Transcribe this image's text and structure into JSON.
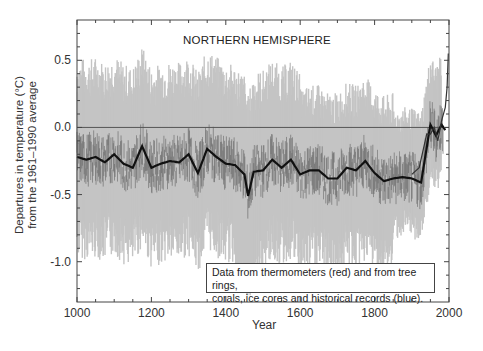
{
  "chart_data": {
    "type": "line",
    "title": "NORTHERN HEMISPHERE",
    "xlabel": "Year",
    "ylabel_line1": "Departures in temperature (°C)",
    "ylabel_line2": "from the 1961–1990 average",
    "xlim": [
      1000,
      2000
    ],
    "ylim": [
      -1.3,
      0.8
    ],
    "xticks": [
      1000,
      1200,
      1400,
      1600,
      1800,
      2000
    ],
    "xtick_labels": [
      "1000",
      "1200",
      "1400",
      "1600",
      "1800",
      "2000"
    ],
    "yticks": [
      0.5,
      0.0,
      -0.5,
      -1.0
    ],
    "ytick_labels": [
      "0.5",
      "0.0",
      "-0.5",
      "-1.0"
    ],
    "reference_line": 0.0,
    "legend_text_line1": "Data from thermometers (red) and from tree rings,",
    "legend_text_line2": "corals, ice cores and historical records (blue).",
    "grid": false,
    "series": [
      {
        "name": "50-year smoothed reconstruction",
        "style": "thick black line",
        "x": [
          1000,
          1025,
          1050,
          1075,
          1100,
          1125,
          1150,
          1175,
          1200,
          1225,
          1250,
          1275,
          1300,
          1325,
          1350,
          1375,
          1400,
          1425,
          1450,
          1460,
          1475,
          1500,
          1525,
          1550,
          1575,
          1600,
          1625,
          1650,
          1675,
          1700,
          1725,
          1750,
          1775,
          1800,
          1825,
          1850,
          1875,
          1900,
          1925,
          1950,
          1965,
          1980,
          1990
        ],
        "values": [
          -0.22,
          -0.24,
          -0.22,
          -0.26,
          -0.2,
          -0.27,
          -0.3,
          -0.14,
          -0.3,
          -0.27,
          -0.25,
          -0.26,
          -0.2,
          -0.34,
          -0.16,
          -0.22,
          -0.27,
          -0.28,
          -0.35,
          -0.51,
          -0.33,
          -0.32,
          -0.24,
          -0.3,
          -0.24,
          -0.35,
          -0.32,
          -0.32,
          -0.38,
          -0.38,
          -0.3,
          -0.32,
          -0.25,
          -0.34,
          -0.4,
          -0.38,
          -0.37,
          -0.38,
          -0.41,
          0.02,
          -0.06,
          0.02,
          -0.02
        ]
      },
      {
        "name": "Thermometer record (recent)",
        "style": "dark line",
        "x": [
          1900,
          1920,
          1940,
          1950,
          1960,
          1970,
          1980,
          1990,
          1995,
          1998
        ],
        "values": [
          -0.35,
          -0.3,
          -0.05,
          -0.05,
          0.0,
          -0.1,
          0.05,
          0.15,
          0.3,
          0.55
        ]
      },
      {
        "name": "95% uncertainty range",
        "style": "light gray band",
        "upper_approx": 0.3,
        "lower_approx": -0.8,
        "note": "band widens to about -1.0 near 1450"
      }
    ]
  }
}
